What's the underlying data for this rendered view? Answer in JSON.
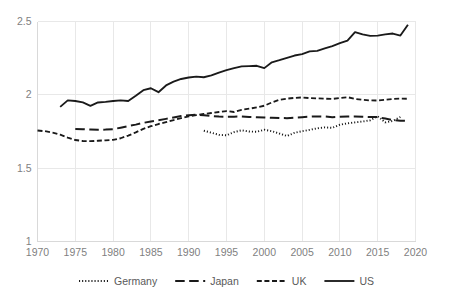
{
  "chart_data": {
    "type": "line",
    "title": "",
    "subtitle": "",
    "xlabel": "",
    "ylabel": "",
    "xlim": [
      1970,
      2020
    ],
    "ylim": [
      1,
      2.5
    ],
    "grid": true,
    "legend_position": "bottom",
    "x_ticks": [
      "1970",
      "1975",
      "1980",
      "1985",
      "1990",
      "1995",
      "2000",
      "2005",
      "2010",
      "2015",
      "2020"
    ],
    "y_ticks": [
      "1",
      "1.5",
      "2",
      "2.5"
    ],
    "series": [
      {
        "name": "Germany",
        "style": "dotted",
        "color": "#1a1a1a",
        "x": [
          1992,
          1993,
          1994,
          1995,
          1996,
          1997,
          1998,
          1999,
          2000,
          2001,
          2002,
          2003,
          2004,
          2005,
          2006,
          2007,
          2008,
          2009,
          2010,
          2011,
          2012,
          2013,
          2014,
          2015,
          2016,
          2017,
          2018
        ],
        "values": [
          1.755,
          1.742,
          1.727,
          1.724,
          1.746,
          1.758,
          1.75,
          1.748,
          1.762,
          1.752,
          1.736,
          1.719,
          1.741,
          1.752,
          1.761,
          1.772,
          1.778,
          1.775,
          1.796,
          1.806,
          1.812,
          1.818,
          1.826,
          1.853,
          1.812,
          1.822,
          1.849
        ]
      },
      {
        "name": "Japan",
        "style": "dashed-long",
        "color": "#1a1a1a",
        "x": [
          1975,
          1976,
          1977,
          1978,
          1979,
          1980,
          1981,
          1982,
          1983,
          1984,
          1985,
          1986,
          1987,
          1988,
          1989,
          1990,
          1991,
          1992,
          1993,
          1994,
          1995,
          1996,
          1997,
          1998,
          1999,
          2000,
          2001,
          2002,
          2003,
          2004,
          2005,
          2006,
          2007,
          2008,
          2009,
          2010,
          2011,
          2012,
          2013,
          2014,
          2015,
          2016,
          2017,
          2018,
          2019
        ],
        "values": [
          1.767,
          1.766,
          1.764,
          1.762,
          1.763,
          1.766,
          1.776,
          1.787,
          1.797,
          1.809,
          1.818,
          1.826,
          1.836,
          1.846,
          1.855,
          1.861,
          1.864,
          1.861,
          1.856,
          1.852,
          1.85,
          1.851,
          1.852,
          1.849,
          1.847,
          1.846,
          1.844,
          1.842,
          1.841,
          1.845,
          1.848,
          1.851,
          1.853,
          1.852,
          1.848,
          1.851,
          1.852,
          1.853,
          1.851,
          1.849,
          1.848,
          1.838,
          1.828,
          1.824,
          1.822
        ]
      },
      {
        "name": "UK",
        "style": "dashed-short",
        "color": "#1a1a1a",
        "x": [
          1970,
          1971,
          1972,
          1973,
          1974,
          1975,
          1976,
          1977,
          1978,
          1979,
          1980,
          1981,
          1982,
          1983,
          1984,
          1985,
          1986,
          1987,
          1988,
          1989,
          1990,
          1991,
          1992,
          1993,
          1994,
          1995,
          1996,
          1997,
          1998,
          1999,
          2000,
          2001,
          2002,
          2003,
          2004,
          2005,
          2006,
          2007,
          2008,
          2009,
          2010,
          2011,
          2012,
          2013,
          2014,
          2015,
          2016,
          2017,
          2018,
          2019
        ],
        "values": [
          1.757,
          1.752,
          1.742,
          1.728,
          1.708,
          1.692,
          1.685,
          1.684,
          1.687,
          1.69,
          1.693,
          1.704,
          1.722,
          1.744,
          1.768,
          1.786,
          1.801,
          1.814,
          1.828,
          1.841,
          1.853,
          1.862,
          1.87,
          1.876,
          1.883,
          1.889,
          1.883,
          1.898,
          1.906,
          1.914,
          1.926,
          1.948,
          1.966,
          1.974,
          1.979,
          1.982,
          1.978,
          1.976,
          1.974,
          1.972,
          1.978,
          1.984,
          1.972,
          1.966,
          1.962,
          1.961,
          1.966,
          1.972,
          1.974,
          1.973
        ]
      },
      {
        "name": "US",
        "style": "solid",
        "color": "#1a1a1a",
        "x": [
          1973,
          1974,
          1975,
          1976,
          1977,
          1978,
          1979,
          1980,
          1981,
          1982,
          1983,
          1984,
          1985,
          1986,
          1987,
          1988,
          1989,
          1990,
          1991,
          1992,
          1993,
          1994,
          1995,
          1996,
          1997,
          1998,
          1999,
          2000,
          2001,
          2002,
          2003,
          2004,
          2005,
          2006,
          2007,
          2008,
          2009,
          2010,
          2011,
          2012,
          2013,
          2014,
          2015,
          2016,
          2017,
          2018,
          2019
        ],
        "values": [
          1.918,
          1.962,
          1.958,
          1.948,
          1.925,
          1.948,
          1.952,
          1.958,
          1.962,
          1.958,
          1.994,
          2.032,
          2.045,
          2.018,
          2.064,
          2.09,
          2.108,
          2.118,
          2.124,
          2.12,
          2.132,
          2.152,
          2.168,
          2.182,
          2.194,
          2.196,
          2.198,
          2.182,
          2.222,
          2.236,
          2.252,
          2.268,
          2.278,
          2.296,
          2.3,
          2.316,
          2.332,
          2.352,
          2.37,
          2.428,
          2.412,
          2.402,
          2.404,
          2.412,
          2.418,
          2.404,
          2.478
        ]
      }
    ],
    "legend": [
      {
        "label": "Germany",
        "style": "dotted"
      },
      {
        "label": "Japan",
        "style": "dashed-long"
      },
      {
        "label": "UK",
        "style": "dashed-short"
      },
      {
        "label": "US",
        "style": "solid"
      }
    ]
  }
}
